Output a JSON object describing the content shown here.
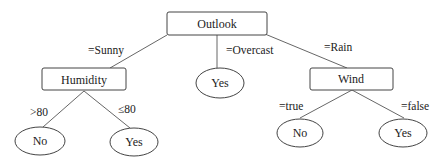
{
  "tree": {
    "root": {
      "label": "Outlook"
    },
    "decision_nodes": {
      "humidity": {
        "label": "Humidity"
      },
      "wind": {
        "label": "Wind"
      }
    },
    "edges": {
      "sunny": "=Sunny",
      "overcast": "=Overcast",
      "rain": "=Rain",
      "humidity_high": ">80",
      "humidity_low": "≤80",
      "wind_true": "=true",
      "wind_false": "=false"
    },
    "leaves": {
      "humidity_high": "No",
      "humidity_low": "Yes",
      "overcast": "Yes",
      "wind_true": "No",
      "wind_false": "Yes"
    }
  }
}
